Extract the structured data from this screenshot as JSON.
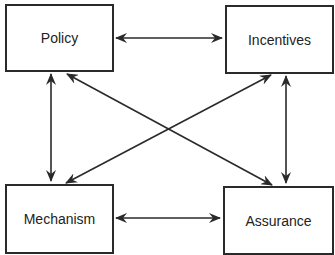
{
  "diagram": {
    "nodes": [
      {
        "id": "policy",
        "label": "Policy"
      },
      {
        "id": "incentives",
        "label": "Incentives"
      },
      {
        "id": "mechanism",
        "label": "Mechanism"
      },
      {
        "id": "assurance",
        "label": "Assurance"
      }
    ],
    "edges": [
      {
        "from": "policy",
        "to": "incentives",
        "direction": "both"
      },
      {
        "from": "policy",
        "to": "mechanism",
        "direction": "both"
      },
      {
        "from": "policy",
        "to": "assurance",
        "direction": "both"
      },
      {
        "from": "incentives",
        "to": "mechanism",
        "direction": "both"
      },
      {
        "from": "incentives",
        "to": "assurance",
        "direction": "both"
      },
      {
        "from": "mechanism",
        "to": "assurance",
        "direction": "both"
      }
    ],
    "colors": {
      "stroke": "#2a2a2a",
      "background": "#ffffff"
    }
  }
}
